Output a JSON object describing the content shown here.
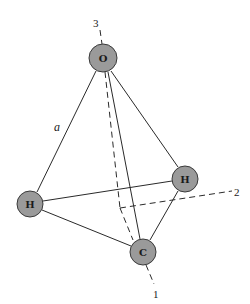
{
  "atoms": {
    "oxygen": {
      "label": "O",
      "cx": 103,
      "cy": 58,
      "r": 14
    },
    "hydrogen_left": {
      "label": "H",
      "cx": 30,
      "cy": 204,
      "r": 13
    },
    "hydrogen_right": {
      "label": "H",
      "cx": 185,
      "cy": 179,
      "r": 13
    },
    "carbon": {
      "label": "C",
      "cx": 143,
      "cy": 252,
      "r": 13
    }
  },
  "axes": {
    "axis1": {
      "label": "1"
    },
    "axis2": {
      "label": "2"
    },
    "axis3": {
      "label": "3"
    }
  },
  "edges": {
    "a": {
      "label": "a"
    }
  },
  "colors": {
    "atom_fill": "#9a9a9a",
    "line": "#2a2a2a",
    "background": "#ffffff"
  }
}
